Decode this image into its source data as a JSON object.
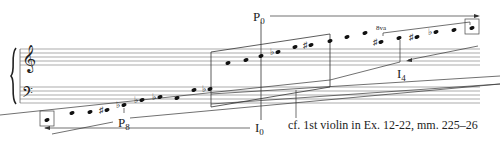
{
  "diagram": {
    "type": "musical-pitch-space",
    "staves": [
      "treble",
      "bass"
    ],
    "labels": {
      "p0": {
        "main": "P",
        "sub": "0"
      },
      "p8": {
        "main": "P",
        "sub": "8"
      },
      "i0": {
        "main": "I",
        "sub": "0"
      },
      "i4": {
        "main": "I",
        "sub": "4"
      },
      "ottava": "8va"
    },
    "caption": "cf. 1st violin in Ex. 12-22, mm. 225–26",
    "bass_notes": [
      {
        "x": 47,
        "y": 120,
        "acc": "",
        "bracket": true
      },
      {
        "x": 72,
        "y": 113,
        "acc": ""
      },
      {
        "x": 90,
        "y": 112,
        "acc": ""
      },
      {
        "x": 107,
        "y": 110,
        "acc": "sharp"
      },
      {
        "x": 124,
        "y": 105,
        "acc": "flat"
      },
      {
        "x": 142,
        "y": 100,
        "acc": "flat"
      },
      {
        "x": 160,
        "y": 97,
        "acc": "flat"
      },
      {
        "x": 177,
        "y": 98,
        "acc": ""
      },
      {
        "x": 194,
        "y": 90,
        "acc": ""
      },
      {
        "x": 210,
        "y": 89,
        "acc": "flat"
      }
    ],
    "treble_notes": [
      {
        "x": 228,
        "y": 63,
        "acc": ""
      },
      {
        "x": 246,
        "y": 60,
        "acc": ""
      },
      {
        "x": 261,
        "y": 56,
        "acc": ""
      },
      {
        "x": 278,
        "y": 52,
        "acc": "flat"
      },
      {
        "x": 295,
        "y": 47,
        "acc": ""
      },
      {
        "x": 311,
        "y": 45,
        "acc": "sharp"
      },
      {
        "x": 330,
        "y": 41,
        "acc": ""
      },
      {
        "x": 347,
        "y": 37,
        "acc": ""
      },
      {
        "x": 365,
        "y": 33,
        "acc": ""
      },
      {
        "x": 381,
        "y": 42,
        "acc": "sharp"
      },
      {
        "x": 399,
        "y": 38,
        "acc": ""
      },
      {
        "x": 417,
        "y": 37,
        "acc": "sharp"
      },
      {
        "x": 436,
        "y": 32,
        "acc": "flat"
      },
      {
        "x": 454,
        "y": 30,
        "acc": ""
      },
      {
        "x": 472,
        "y": 28,
        "acc": "",
        "bracket": true
      }
    ]
  }
}
